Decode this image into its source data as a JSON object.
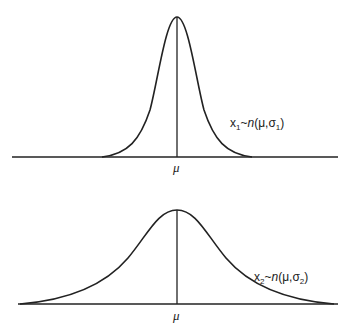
{
  "diagram": {
    "title": "",
    "top_panel": {
      "label_var": "x",
      "label_sub": "1",
      "label_dist": "~",
      "label_n": "n",
      "label_args_open": "(μ,σ",
      "label_sigma_sub": "1",
      "label_args_close": ")",
      "axis_label": "μ",
      "description": "narrow normal distribution, small variance"
    },
    "bottom_panel": {
      "label_var": "x",
      "label_sub": "2",
      "label_dist": "~",
      "label_n": "n",
      "label_args_open": "(μ,σ",
      "label_sigma_sub": "2",
      "label_args_close": ")",
      "axis_label": "μ",
      "description": "wide normal distribution, large variance"
    },
    "colors": {
      "line": "#222222",
      "background": "#ffffff"
    }
  }
}
